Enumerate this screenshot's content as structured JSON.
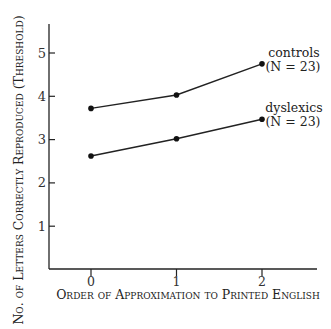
{
  "chart_data": {
    "type": "line",
    "title": "",
    "xlabel": "Order of Approximation to Printed English",
    "ylabel": "No. of Letters Correctly Reproduced (Threshold)",
    "x": [
      0,
      1,
      2
    ],
    "x_ticks": [
      "0",
      "1",
      "2"
    ],
    "y_ticks": [
      "1",
      "2",
      "3",
      "4",
      "5"
    ],
    "ylim": [
      0,
      5.7
    ],
    "grid": false,
    "legend_position": "inline-right",
    "series": [
      {
        "name": "controls",
        "label_line1": "controls",
        "label_line2": "(N = 23)",
        "values": [
          3.72,
          4.03,
          4.75
        ]
      },
      {
        "name": "dyslexics",
        "label_line1": "dyslexics",
        "label_line2": "(N = 23)",
        "values": [
          2.62,
          3.02,
          3.47
        ]
      }
    ]
  }
}
